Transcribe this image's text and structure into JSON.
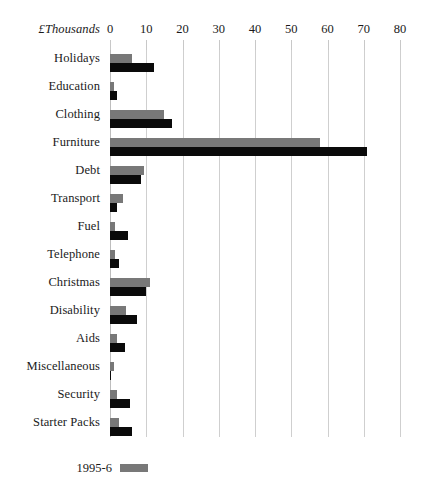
{
  "chart_data": {
    "type": "bar",
    "orientation": "horizontal",
    "title": "",
    "xlabel": "£Thousands",
    "ylabel": "",
    "xlim": [
      0,
      80
    ],
    "xticks": [
      0,
      10,
      20,
      30,
      40,
      50,
      60,
      70,
      80
    ],
    "xtick_labels": [
      "0",
      "10",
      "20",
      "30",
      "40",
      "50",
      "60",
      "70",
      "80"
    ],
    "grid": true,
    "legend_position": "bottom-left",
    "categories": [
      "Holidays",
      "Education",
      "Clothing",
      "Furniture",
      "Debt",
      "Transport",
      "Fuel",
      "Telephone",
      "Christmas",
      "Disability",
      "Aids",
      "Miscellaneous",
      "Security",
      "Starter Packs"
    ],
    "series": [
      {
        "name": "1995-6",
        "color": "#787878",
        "values": [
          6,
          1,
          15,
          58,
          9.5,
          3.5,
          1.5,
          1.5,
          11,
          4.5,
          2,
          1,
          2,
          2.5
        ]
      },
      {
        "name": "",
        "color": "#0a0a0a",
        "values": [
          12,
          2,
          17,
          71,
          8.5,
          2,
          5,
          2.5,
          10,
          7.5,
          4,
          0.3,
          5.5,
          6
        ]
      }
    ]
  },
  "legend": {
    "entries": [
      {
        "label": "1995-6",
        "color": "#787878"
      }
    ]
  }
}
